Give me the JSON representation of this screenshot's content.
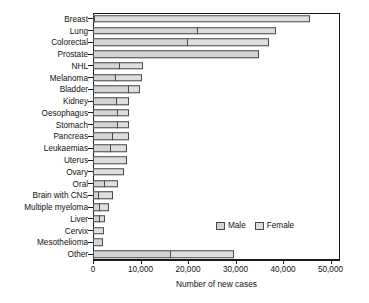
{
  "chart_data": {
    "type": "bar",
    "orientation": "horizontal",
    "stacked": true,
    "title": "",
    "xlabel": "Number of new cases",
    "ylabel": "",
    "xlim": [
      0,
      52000
    ],
    "xticks": [
      0,
      10000,
      20000,
      30000,
      40000,
      50000
    ],
    "xticklabels": [
      "0",
      "10,000",
      "20,000",
      "30,000",
      "40,000",
      "50,000"
    ],
    "grid": false,
    "legend": {
      "position": "inside-lower-right",
      "entries": [
        {
          "name": "Male",
          "color": "#d4d4d4"
        },
        {
          "name": "Female",
          "color": "#dedede"
        }
      ]
    },
    "categories": [
      "Breast",
      "Lung",
      "Colorectal",
      "Prostate",
      "NHL",
      "Melanoma",
      "Bladder",
      "Kidney",
      "Oesophagus",
      "Stomach",
      "Pancreas",
      "Leukaemias",
      "Uterus",
      "Ovary",
      "Oral",
      "Brain with CNS",
      "Multiple myeloma",
      "Liver",
      "Cervix",
      "Mesothelioma",
      "Other"
    ],
    "series": [
      {
        "name": "Male",
        "values": [
          300,
          22100,
          20000,
          34900,
          5600,
          4800,
          7600,
          5000,
          5200,
          5200,
          4200,
          3800,
          0,
          0,
          2600,
          1300,
          1400,
          1500,
          0,
          2000,
          16500
        ]
      },
      {
        "name": "Female",
        "values": [
          45400,
          16700,
          17200,
          0,
          5100,
          5700,
          2600,
          2800,
          2500,
          2500,
          3600,
          3600,
          7100,
          6600,
          2800,
          3100,
          2200,
          1300,
          2400,
          0,
          13400
        ]
      }
    ],
    "totals": [
      45700,
      38800,
      37200,
      34900,
      10700,
      10500,
      10200,
      7800,
      7700,
      7700,
      7800,
      7400,
      7100,
      6600,
      5400,
      4400,
      3600,
      2800,
      2400,
      2000,
      29900
    ]
  }
}
